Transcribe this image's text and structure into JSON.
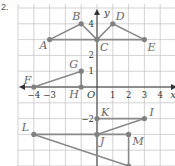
{
  "problem_number": "2.",
  "axes": {
    "x_label": "x",
    "y_label": "y",
    "origin_label": "O",
    "x_ticks": [
      {
        "value": -4,
        "label": "−4"
      },
      {
        "value": -3,
        "label": "−3"
      },
      {
        "value": 1,
        "label": "1"
      },
      {
        "value": 2,
        "label": "2"
      },
      {
        "value": 3,
        "label": "3"
      },
      {
        "value": 4,
        "label": "4"
      }
    ],
    "y_ticks": [
      {
        "value": 4,
        "label": "4"
      },
      {
        "value": 2,
        "label": "2"
      },
      {
        "value": 1,
        "label": "1"
      },
      {
        "value": -2,
        "label": "−2"
      }
    ],
    "x_range": [
      -5,
      5
    ],
    "y_range": [
      -5,
      5
    ]
  },
  "points": [
    {
      "name": "A",
      "x": -3,
      "y": 3
    },
    {
      "name": "B",
      "x": -1,
      "y": 4
    },
    {
      "name": "C",
      "x": 0,
      "y": 3
    },
    {
      "name": "D",
      "x": 1,
      "y": 4
    },
    {
      "name": "E",
      "x": 3,
      "y": 3
    },
    {
      "name": "F",
      "x": -4,
      "y": 0
    },
    {
      "name": "G",
      "x": -1,
      "y": 1
    },
    {
      "name": "H",
      "x": -1,
      "y": 0
    },
    {
      "name": "I",
      "x": 3,
      "y": -2
    },
    {
      "name": "J",
      "x": 0,
      "y": -3
    },
    {
      "name": "K",
      "x": 0,
      "y": -2
    },
    {
      "name": "L",
      "x": -4,
      "y": -3
    },
    {
      "name": "M",
      "x": 2,
      "y": -3
    },
    {
      "name": "N",
      "x": 2,
      "y": -5
    }
  ],
  "segments": [
    [
      "A",
      "B"
    ],
    [
      "B",
      "C"
    ],
    [
      "C",
      "D"
    ],
    [
      "D",
      "E"
    ],
    [
      "A",
      "E"
    ],
    [
      "F",
      "G"
    ],
    [
      "G",
      "H"
    ],
    [
      "F",
      "H"
    ],
    [
      "K",
      "I"
    ],
    [
      "I",
      "J"
    ],
    [
      "L",
      "M"
    ],
    [
      "M",
      "N"
    ],
    [
      "L",
      "N"
    ]
  ],
  "colors": {
    "grid": "#c8c8c8",
    "axis": "#333333",
    "segment": "#8a8a8a",
    "point": "#808080",
    "label": "#666666"
  }
}
